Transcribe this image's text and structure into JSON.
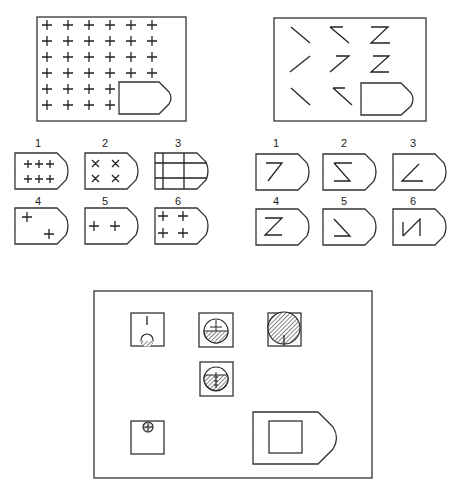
{
  "puzzle_1": {
    "description": "Matrix of plus signs with missing region",
    "grid": {
      "rows": 6,
      "cols": 6,
      "row_counts": [
        6,
        6,
        6,
        6,
        4,
        4
      ],
      "glyph": "plus"
    },
    "options": [
      {
        "label": "1",
        "content": "two rows of three plus signs"
      },
      {
        "label": "2",
        "content": "four X marks in 2x2"
      },
      {
        "label": "3",
        "content": "grid lines (two horizontal, two vertical)"
      },
      {
        "label": "4",
        "content": "two plus signs diagonal (top-left, bottom-right)"
      },
      {
        "label": "5",
        "content": "two plus signs in a row"
      },
      {
        "label": "6",
        "content": "four plus signs in 2x2"
      }
    ]
  },
  "puzzle_2": {
    "description": "Matrix of stroke figures with missing cell",
    "cells": [
      [
        "backslash",
        "open-z-top",
        "z-with-bottom"
      ],
      [
        "slash",
        "seven",
        "z"
      ],
      [
        "backslash",
        "open-z-top",
        "missing"
      ]
    ],
    "options": [
      {
        "label": "1",
        "content": "seven shape"
      },
      {
        "label": "2",
        "content": "sigma shape"
      },
      {
        "label": "3",
        "content": "angle opening right"
      },
      {
        "label": "4",
        "content": "Z shape"
      },
      {
        "label": "5",
        "content": "backslash with bottom line"
      },
      {
        "label": "6",
        "content": "N-like shape"
      }
    ]
  },
  "puzzle_3": {
    "description": "Arrangement of squares with circles and shading; answer pentagon with empty square",
    "cells": [
      {
        "name": "cell-top-left",
        "content": "vertical tick above small circle, circle bottom shaded"
      },
      {
        "name": "cell-top-middle",
        "content": "medium circle, lower half hatched, cross at center"
      },
      {
        "name": "cell-top-right",
        "content": "large circle fully hatched with vertical line at bottom"
      },
      {
        "name": "cell-middle",
        "content": "medium circle mostly hatched, vertical line with ticks"
      },
      {
        "name": "cell-bottom-left",
        "content": "small circle at top with cross, hatched"
      },
      {
        "name": "answer-slot",
        "content": "empty square inside pentagon"
      }
    ]
  }
}
